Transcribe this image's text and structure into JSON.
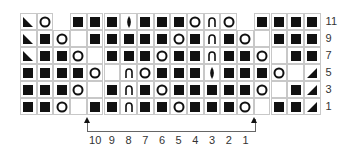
{
  "chart_data": {
    "type": "table",
    "legend": {
      "K": "filled square",
      "O": "open circle (yarn over)",
      "A": "inverted U / arch symbol",
      "D": "vertical diamond (centered double decrease)",
      "L": "left-pointing corner triangle",
      "R": "right-pointing corner triangle",
      "-": "empty cell (no stitch)",
      "X": "no cell"
    },
    "columns": 18,
    "rows": [
      {
        "label": "11",
        "cells": [
          "L",
          "O",
          "X",
          "K",
          "K",
          "K",
          "D",
          "K",
          "K",
          "K",
          "O",
          "A",
          "O",
          "X",
          "K",
          "K",
          "K",
          "K"
        ]
      },
      {
        "label": "9",
        "cells": [
          "L",
          "K",
          "O",
          "-",
          "K",
          "K",
          "K",
          "K",
          "K",
          "O",
          "K",
          "A",
          "K",
          "O",
          "-",
          "K",
          "K",
          "K"
        ]
      },
      {
        "label": "7",
        "cells": [
          "L",
          "K",
          "K",
          "O",
          "-",
          "K",
          "K",
          "K",
          "O",
          "K",
          "K",
          "A",
          "K",
          "K",
          "O",
          "-",
          "K",
          "K"
        ]
      },
      {
        "label": "5",
        "cells": [
          "K",
          "K",
          "K",
          "K",
          "O",
          "-",
          "A",
          "O",
          "K",
          "K",
          "K",
          "D",
          "K",
          "K",
          "K",
          "O",
          "-",
          "R"
        ]
      },
      {
        "label": "3",
        "cells": [
          "K",
          "K",
          "K",
          "O",
          "-",
          "K",
          "A",
          "K",
          "O",
          "K",
          "K",
          "K",
          "K",
          "K",
          "O",
          "-",
          "K",
          "R"
        ]
      },
      {
        "label": "1",
        "cells": [
          "K",
          "K",
          "O",
          "-",
          "K",
          "K",
          "A",
          "K",
          "K",
          "O",
          "K",
          "K",
          "K",
          "O",
          "-",
          "K",
          "K",
          "R"
        ]
      }
    ],
    "repeat_columns": [
      "10",
      "9",
      "8",
      "7",
      "6",
      "5",
      "4",
      "3",
      "2",
      "1"
    ],
    "repeat_span": {
      "start_col": 5,
      "end_col": 14
    }
  }
}
